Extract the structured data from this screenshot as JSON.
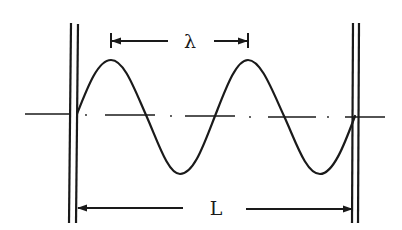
{
  "diagram": {
    "type": "standing-wave-between-walls",
    "labels": {
      "wavelength": "λ",
      "length": "L"
    },
    "colors": {
      "stroke": "#1a1a1a",
      "background": "#ffffff"
    },
    "geometry": {
      "axis_y": 114,
      "left_wall_x": [
        70,
        77
      ],
      "right_wall_x": [
        353,
        358
      ],
      "wall_top_y": 23,
      "wall_bottom_y": 223,
      "wave_start_x": 77,
      "wave_end_x": 355,
      "wave_amplitude": 57,
      "wavelength_px": 138,
      "cycles": 2
    }
  }
}
